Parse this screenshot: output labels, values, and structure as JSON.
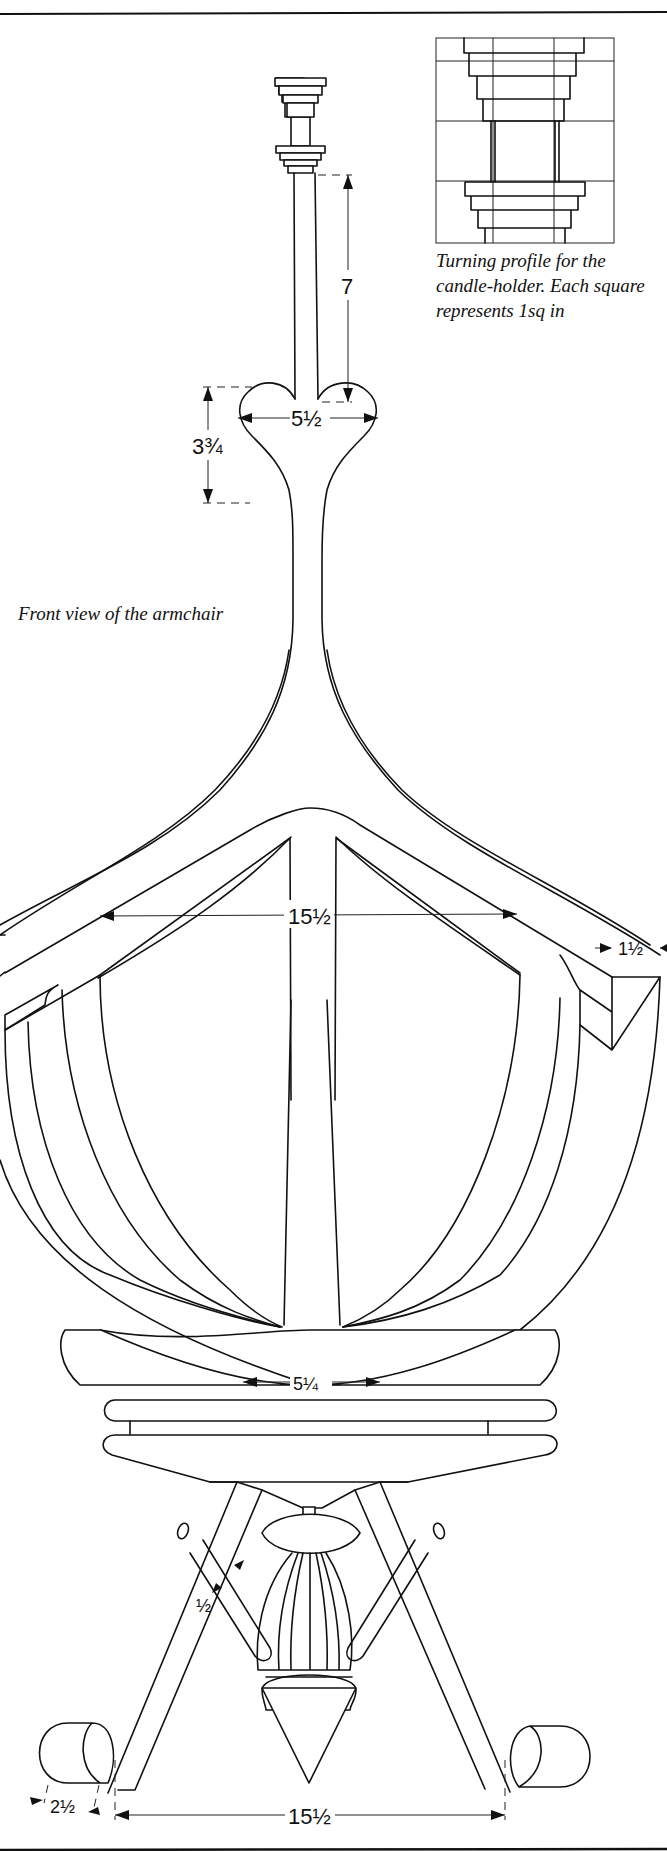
{
  "captions": {
    "turning_profile": "Turning profile for the candle-holder. Each square represents 1sq in",
    "front_view": "Front view of the armchair"
  },
  "dimensions": {
    "stem_height": "7",
    "crest_width": "5½",
    "crest_height": "3¾",
    "seat_inner_width": "15½",
    "arm_thickness": "1½",
    "leg_top_spacing": "5¼",
    "stretcher_thickness": "½",
    "foot_width": "2½",
    "foot_spacing": "15½"
  },
  "profile_grid": {
    "columns": 3,
    "rows": 4,
    "unit": "1sq in"
  },
  "colors": {
    "ink": "#111111",
    "paper": "#ffffff"
  }
}
